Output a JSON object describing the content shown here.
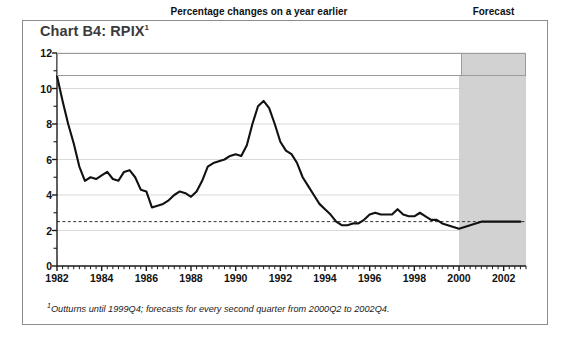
{
  "chart_title": "Chart B4: RPIX",
  "chart_title_marker": "1",
  "banner_main_label": "Percentage changes on a year earlier",
  "banner_forecast_label": "Forecast",
  "footnote_marker": "1",
  "footnote_text": "Outturns until 1999Q4; forecasts for every second quarter from 2000Q2 to 2002Q4.",
  "colors": {
    "line": "#111111",
    "forecast_shade": "#d2d2d2",
    "gridline": "#cfcfcf",
    "axis": "#1a1a1a",
    "frame": "#8c8c8c",
    "title": "#3a3a3a",
    "target_line": "#333333"
  },
  "chart_data": {
    "type": "line",
    "title": "Chart B4: RPIX",
    "subtitle": "Percentage changes on a year earlier",
    "xlabel": "",
    "ylabel": "",
    "xlim": [
      1982.0,
      2003.0
    ],
    "ylim": [
      0,
      12
    ],
    "yticks": [
      0,
      2,
      4,
      6,
      8,
      10,
      12
    ],
    "ytick_labels": [
      "0",
      "2",
      "4",
      "6",
      "8",
      "10",
      "12"
    ],
    "yminor_step": 1,
    "xticks": [
      1982,
      1984,
      1986,
      1988,
      1990,
      1992,
      1994,
      1996,
      1998,
      2000,
      2002
    ],
    "xtick_labels": [
      "1982",
      "1984",
      "1986",
      "1988",
      "1990",
      "1992",
      "1994",
      "1996",
      "1998",
      "2000",
      "2002"
    ],
    "xminor_step": 0.25,
    "grid": true,
    "grid_axis": "y",
    "legend": "none",
    "annotations": [
      {
        "text": "Percentage changes on a year earlier",
        "type": "banner"
      },
      {
        "text": "Forecast",
        "type": "banner",
        "shaded": true
      }
    ],
    "target_line": {
      "value": 2.5,
      "style": "dashed",
      "label": ""
    },
    "forecast_region": {
      "start": 2000.0,
      "end": 2003.0,
      "shaded": true
    },
    "series": [
      {
        "name": "RPIX",
        "x": [
          1982.0,
          1982.25,
          1982.5,
          1982.75,
          1983.0,
          1983.25,
          1983.5,
          1983.75,
          1984.0,
          1984.25,
          1984.5,
          1984.75,
          1985.0,
          1985.25,
          1985.5,
          1985.75,
          1986.0,
          1986.25,
          1986.5,
          1986.75,
          1987.0,
          1987.25,
          1987.5,
          1987.75,
          1988.0,
          1988.25,
          1988.5,
          1988.75,
          1989.0,
          1989.25,
          1989.5,
          1989.75,
          1990.0,
          1990.25,
          1990.5,
          1990.75,
          1991.0,
          1991.25,
          1991.5,
          1991.75,
          1992.0,
          1992.25,
          1992.5,
          1992.75,
          1993.0,
          1993.25,
          1993.5,
          1993.75,
          1994.0,
          1994.25,
          1994.5,
          1994.75,
          1995.0,
          1995.25,
          1995.5,
          1995.75,
          1996.0,
          1996.25,
          1996.5,
          1996.75,
          1997.0,
          1997.25,
          1997.5,
          1997.75,
          1998.0,
          1998.25,
          1998.5,
          1998.75,
          1999.0,
          1999.25,
          1999.5,
          1999.75,
          2000.0,
          2000.5,
          2001.0,
          2001.5,
          2002.0,
          2002.5,
          2002.75
        ],
        "y": [
          10.7,
          9.3,
          8.0,
          6.9,
          5.6,
          4.8,
          5.0,
          4.9,
          5.1,
          5.3,
          4.9,
          4.8,
          5.3,
          5.4,
          5.0,
          4.3,
          4.2,
          3.3,
          3.4,
          3.5,
          3.7,
          4.0,
          4.2,
          4.1,
          3.9,
          4.2,
          4.8,
          5.6,
          5.8,
          5.9,
          6.0,
          6.2,
          6.3,
          6.2,
          6.8,
          8.0,
          9.0,
          9.3,
          8.9,
          8.0,
          7.0,
          6.5,
          6.3,
          5.8,
          5.0,
          4.5,
          4.0,
          3.5,
          3.2,
          2.9,
          2.5,
          2.3,
          2.3,
          2.4,
          2.4,
          2.6,
          2.9,
          3.0,
          2.9,
          2.9,
          2.9,
          3.2,
          2.9,
          2.8,
          2.8,
          3.0,
          2.8,
          2.6,
          2.6,
          2.4,
          2.3,
          2.2,
          2.1,
          2.3,
          2.5,
          2.5,
          2.5,
          2.5,
          2.5
        ],
        "color": "#111111",
        "linewidth": 2.1
      }
    ]
  }
}
